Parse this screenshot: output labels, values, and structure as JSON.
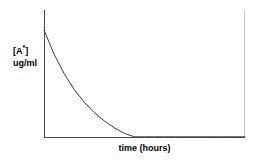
{
  "chart_data": {
    "type": "line",
    "title": "",
    "subtitle": "",
    "xlabel": "time (hours)",
    "ylabel_line1_base": "[A",
    "ylabel_line1_sup": "*",
    "ylabel_line1_close": "]",
    "ylabel_line2": "ug/ml",
    "ylabel_full": "[A*] ug/ml",
    "grid": false,
    "legend": false,
    "legend_position": "none",
    "x_tick_labels": [],
    "y_tick_labels": [],
    "xlim": [
      0,
      10
    ],
    "ylim": [
      0,
      100
    ],
    "series": [
      {
        "name": "[A*] decay",
        "description": "first-order exponential decay of drug concentration over time",
        "model": "C(t) = C0 * exp(-k*t)",
        "C0": 100,
        "k": 0.42,
        "x": [
          0,
          0.5,
          1,
          1.5,
          2,
          2.5,
          3,
          3.5,
          4,
          4.5,
          5,
          5.5,
          6,
          6.5,
          7,
          7.5,
          8,
          8.5,
          9,
          9.5,
          10
        ],
        "values": [
          100,
          81,
          65.7,
          53.2,
          43.2,
          35,
          28.4,
          23,
          18.6,
          15.1,
          12.2,
          9.9,
          8,
          6.5,
          5.3,
          4.3,
          3.5,
          2.8,
          2.3,
          1.8,
          1.5
        ]
      }
    ],
    "colors": {
      "curve": "#3a3a3a",
      "axis": "#4a4a4a",
      "right_border": "#c8c8c8",
      "background": "#ffffff",
      "text": "#000000"
    },
    "axes_geometry": {
      "origin_x": 44,
      "origin_y": 137,
      "y_axis_top": 10,
      "x_axis_right": 245,
      "curve_start_x": 45,
      "curve_start_y": 30,
      "right_border_x": 244
    }
  }
}
